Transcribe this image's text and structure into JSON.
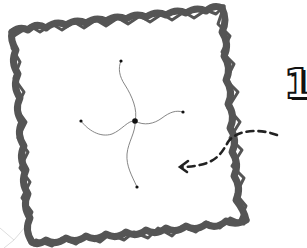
{
  "diagram": {
    "type": "hand-drawn sketch",
    "step_number": "1",
    "frame": {
      "shape": "scribbled square (slightly rotated)",
      "stroke_color": "#555555",
      "corners": [
        [
          14,
          30
        ],
        [
          222,
          5
        ],
        [
          248,
          220
        ],
        [
          32,
          242
        ]
      ]
    },
    "pinwheel": {
      "center": [
        135,
        121
      ],
      "center_color": "#111111",
      "tendril_color": "#777777",
      "endpoints": [
        {
          "name": "top",
          "x": 121,
          "y": 61
        },
        {
          "name": "right",
          "x": 183,
          "y": 112
        },
        {
          "name": "bottom",
          "x": 137,
          "y": 187
        },
        {
          "name": "left",
          "x": 81,
          "y": 121
        }
      ]
    },
    "arrow": {
      "style": "dashed curved arrow",
      "color": "#222222",
      "from": [
        277,
        135
      ],
      "to": [
        180,
        167
      ],
      "direction": "pointing left into frame"
    }
  }
}
